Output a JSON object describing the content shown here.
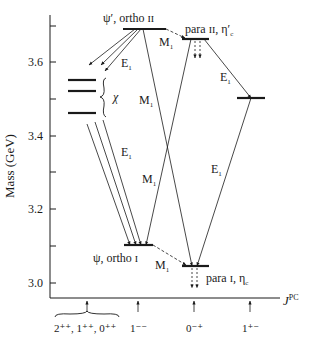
{
  "axes": {
    "y_label": "Mass (GeV)",
    "y_ticks": [
      "3.6",
      "3.4",
      "3.2",
      "3.0"
    ],
    "x_label": "J",
    "x_label_sup": "PC",
    "x_categories": [
      "2⁺⁺, 1⁺⁺, 0⁺⁺",
      "1⁻⁻",
      "0⁻⁺",
      "1⁺⁻"
    ]
  },
  "levels": {
    "psi_prime": "ψ′, ortho ɪɪ",
    "para_2": "para ɪɪ, η′",
    "para_2_sub": "c",
    "chi": "χ",
    "psi": "ψ, ortho ɪ",
    "para_1": "para ɪ, η",
    "para_1_sub": "c"
  },
  "transitions": {
    "e1": "E",
    "m1": "M",
    "sub": "1"
  }
}
